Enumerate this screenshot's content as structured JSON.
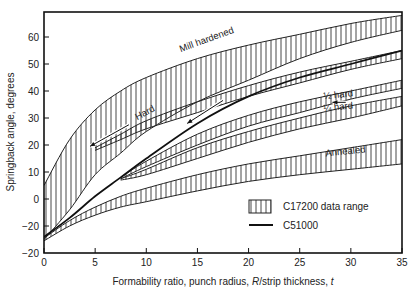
{
  "chart_data": {
    "type": "area",
    "title": "",
    "xlabel": "Formability ratio, punch radius, R/strip thickness, t",
    "xlabel_parts": [
      "Formability ratio, punch radius, ",
      "R",
      "/strip thickness, ",
      "t"
    ],
    "ylabel": "Springback angle, degrees",
    "xlim": [
      0,
      35
    ],
    "ylim": [
      -20,
      70
    ],
    "x_ticks": [
      0,
      5,
      10,
      15,
      20,
      25,
      30,
      35
    ],
    "x_tick_labels": [
      "0",
      "5",
      "10",
      "15",
      "20",
      "25",
      "30",
      "35"
    ],
    "y_ticks": [
      60,
      50,
      40,
      30,
      20,
      10,
      0,
      -10,
      -20
    ],
    "y_tick_labels": [
      "60",
      "50",
      "40",
      "30",
      "20",
      "10",
      "0",
      "−20",
      "−20"
    ],
    "grid": false,
    "legend": {
      "position": "lower right",
      "entries": [
        {
          "label": "C17200 data range",
          "style": "hatched-box"
        },
        {
          "label": "C51000",
          "style": "solid-line"
        }
      ]
    },
    "x": [
      0,
      2.5,
      5,
      7.5,
      10,
      15,
      20,
      25,
      30,
      35
    ],
    "series": [
      {
        "name": "Mill hardened",
        "kind": "band",
        "upper": [
          5,
          22,
          33,
          40,
          45,
          52,
          57,
          61,
          65,
          68
        ],
        "lower": [
          -15,
          -4,
          9,
          17,
          25,
          36,
          44,
          52,
          58,
          62.5
        ]
      },
      {
        "name": "Hard",
        "kind": "band",
        "upper": [
          null,
          null,
          19,
          24,
          29,
          36,
          42,
          47,
          51,
          55
        ],
        "lower": [
          null,
          null,
          18,
          22,
          26,
          32,
          38,
          43,
          48,
          52
        ]
      },
      {
        "name": "1/2 hard",
        "kind": "band",
        "upper": [
          null,
          null,
          null,
          8,
          14,
          24,
          31,
          36,
          40,
          44
        ],
        "lower": [
          null,
          null,
          null,
          7.5,
          12,
          20,
          27,
          32,
          37,
          41
        ]
      },
      {
        "name": "1/4 hard",
        "kind": "band",
        "upper": [
          null,
          null,
          null,
          7.5,
          11,
          19,
          25,
          30,
          34.5,
          38
        ],
        "lower": [
          null,
          null,
          null,
          7,
          9,
          15,
          21,
          26,
          30,
          34.5
        ]
      },
      {
        "name": "Annealed",
        "kind": "band",
        "upper": [
          -14.5,
          -8,
          -3,
          1,
          4,
          9,
          13,
          16,
          19,
          22
        ],
        "lower": [
          -15.5,
          -10,
          -6,
          -3,
          -1,
          3,
          6.5,
          9,
          11,
          13
        ]
      },
      {
        "name": "C51000",
        "kind": "line",
        "values": [
          -14,
          -7,
          1,
          8,
          15,
          28,
          38,
          45,
          50,
          55
        ]
      }
    ],
    "annotations": [
      {
        "text": "Mill hardened",
        "x": 16,
        "y": 58,
        "rotate": -20
      },
      {
        "text": "Hard",
        "x": 10,
        "y": 31,
        "rotate": -28
      },
      {
        "text": "½ hard",
        "x": 28.8,
        "y": 37.5,
        "rotate": -6
      },
      {
        "text": "¼ hard",
        "x": 28.8,
        "y": 33,
        "rotate": -6
      },
      {
        "text": "Annealed",
        "x": 29.5,
        "y": 16.5,
        "rotate": -6
      }
    ]
  },
  "legend_labels": {
    "range": "C17200 data range",
    "line": "C51000"
  },
  "axis_labels": {
    "y": "Springback angle, degrees"
  }
}
